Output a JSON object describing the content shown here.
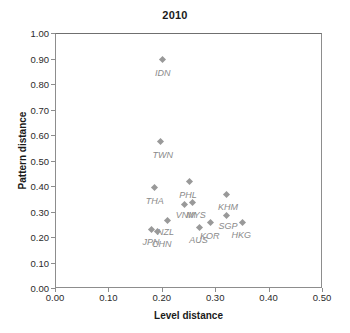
{
  "chart_data": {
    "type": "scatter",
    "title": "2010",
    "xlabel": "Level distance",
    "ylabel": "Pattern distance",
    "xlim": [
      0.0,
      0.5
    ],
    "ylim": [
      0.0,
      1.0
    ],
    "xticks": [
      "0.00",
      "0.10",
      "0.20",
      "0.30",
      "0.40",
      "0.50"
    ],
    "xtick_values": [
      0.0,
      0.1,
      0.2,
      0.3,
      0.4,
      0.5
    ],
    "yticks": [
      "0.00",
      "0.10",
      "0.20",
      "0.30",
      "0.40",
      "0.50",
      "0.60",
      "0.70",
      "0.80",
      "0.90",
      "1.00"
    ],
    "ytick_values": [
      0.0,
      0.1,
      0.2,
      0.3,
      0.4,
      0.5,
      0.6,
      0.7,
      0.8,
      0.9,
      1.0
    ],
    "grid": false,
    "legend": "none",
    "marker_color": "#999999",
    "label_color": "#8a8a8a",
    "frame_color": "#8d8d8d",
    "points": [
      {
        "label": "IDN",
        "x": 0.2,
        "y": 0.9,
        "lx": 0.2,
        "ly": 0.845
      },
      {
        "label": "TWN",
        "x": 0.195,
        "y": 0.58,
        "lx": 0.2,
        "ly": 0.523
      },
      {
        "label": "THA",
        "x": 0.185,
        "y": 0.4,
        "lx": 0.185,
        "ly": 0.34
      },
      {
        "label": "PHL",
        "x": 0.25,
        "y": 0.42,
        "lx": 0.247,
        "ly": 0.365
      },
      {
        "label": "VNM",
        "x": 0.24,
        "y": 0.33,
        "lx": 0.243,
        "ly": 0.288
      },
      {
        "label": "MYS",
        "x": 0.255,
        "y": 0.34,
        "lx": 0.262,
        "ly": 0.288
      },
      {
        "label": "KHM",
        "x": 0.32,
        "y": 0.37,
        "lx": 0.322,
        "ly": 0.318
      },
      {
        "label": "NZL",
        "x": 0.208,
        "y": 0.27,
        "lx": 0.205,
        "ly": 0.218
      },
      {
        "label": "SGP",
        "x": 0.32,
        "y": 0.29,
        "lx": 0.322,
        "ly": 0.243
      },
      {
        "label": "HKG",
        "x": 0.35,
        "y": 0.262,
        "lx": 0.347,
        "ly": 0.208
      },
      {
        "label": "KOR",
        "x": 0.29,
        "y": 0.262,
        "lx": 0.288,
        "ly": 0.205
      },
      {
        "label": "AUS",
        "x": 0.268,
        "y": 0.24,
        "lx": 0.267,
        "ly": 0.187
      },
      {
        "label": "JPN",
        "x": 0.178,
        "y": 0.232,
        "lx": 0.178,
        "ly": 0.18
      },
      {
        "label": "CHN",
        "x": 0.19,
        "y": 0.225,
        "lx": 0.198,
        "ly": 0.172
      }
    ]
  }
}
